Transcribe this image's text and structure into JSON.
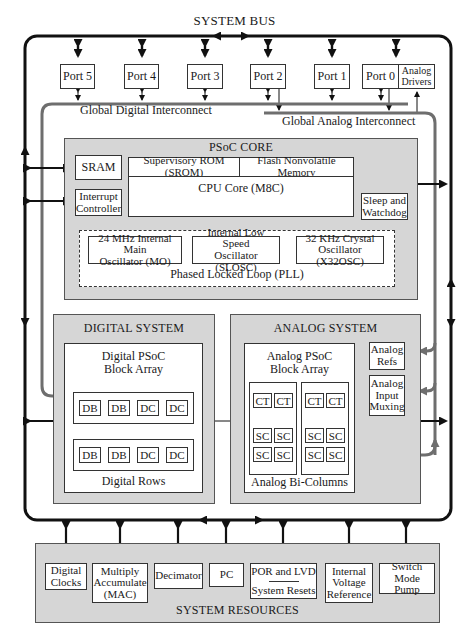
{
  "title": "SYSTEM BUS",
  "ports": [
    {
      "label": "Port 5"
    },
    {
      "label": "Port 4"
    },
    {
      "label": "Port 3"
    },
    {
      "label": "Port 2"
    },
    {
      "label": "Port 1"
    },
    {
      "label": "Port 0"
    }
  ],
  "analog_drivers": "Analog Drivers",
  "interconnect": {
    "digital": "Global Digital Interconnect",
    "analog": "Global Analog Interconnect"
  },
  "core": {
    "title": "PSoC CORE",
    "sram": "SRAM",
    "interrupt_controller": "Interrupt Controller",
    "srom": "Supervisory ROM (SROM)",
    "flash": "Flash Nonvolatile Memory",
    "cpu": "CPU Core (M8C)",
    "sleep_watchdog": "Sleep and Watchdog",
    "oscillators": [
      {
        "line1": "24 MHz Internal Main",
        "line2": "Oscillator (MO)"
      },
      {
        "line1": "Internal Low Speed",
        "line2": "Oscillator (SLOSC)"
      },
      {
        "line1": "32 KHz Crystal",
        "line2": "Oscillator (X32OSC)"
      }
    ],
    "pll": "Phased Locked Loop (PLL)"
  },
  "digital_system": {
    "title": "DIGITAL SYSTEM",
    "array_line1": "Digital PSoC",
    "array_line2": "Block Array",
    "rows": [
      [
        "DB",
        "DB",
        "DC",
        "DC"
      ],
      [
        "DB",
        "DB",
        "DC",
        "DC"
      ]
    ],
    "rows_label": "Digital Rows"
  },
  "analog_system": {
    "title": "ANALOG SYSTEM",
    "array_line1": "Analog PSoC",
    "array_line2": "Block Array",
    "columns": [
      {
        "ct": [
          "CT",
          "CT"
        ],
        "sc": [
          [
            "SC",
            "SC"
          ],
          [
            "SC",
            "SC"
          ]
        ]
      },
      {
        "ct": [
          "CT",
          "CT"
        ],
        "sc": [
          [
            "SC",
            "SC"
          ],
          [
            "SC",
            "SC"
          ]
        ]
      }
    ],
    "columns_label": "Analog Bi-Columns",
    "refs_line1": "Analog",
    "refs_line2": "Refs",
    "mux_line1": "Analog",
    "mux_line2": "Input",
    "mux_line3": "Muxing"
  },
  "system_resources": {
    "title": "SYSTEM RESOURCES",
    "items": [
      {
        "lines": [
          "Digital",
          "Clocks"
        ]
      },
      {
        "lines": [
          "Multiply",
          "Accumulate",
          "(MAC)"
        ]
      },
      {
        "lines": [
          "Decimator"
        ]
      },
      {
        "lines": [
          "PC"
        ]
      },
      {
        "lines": [
          "POR and LVD",
          "System Resets"
        ]
      },
      {
        "lines": [
          "Internal",
          "Voltage",
          "Reference"
        ]
      },
      {
        "lines": [
          "Switch",
          "Mode Pump"
        ]
      }
    ]
  },
  "colors": {
    "bus": "#111111",
    "grey_panel": "#d6d6d6",
    "interconnect": "#6e6e6e"
  }
}
